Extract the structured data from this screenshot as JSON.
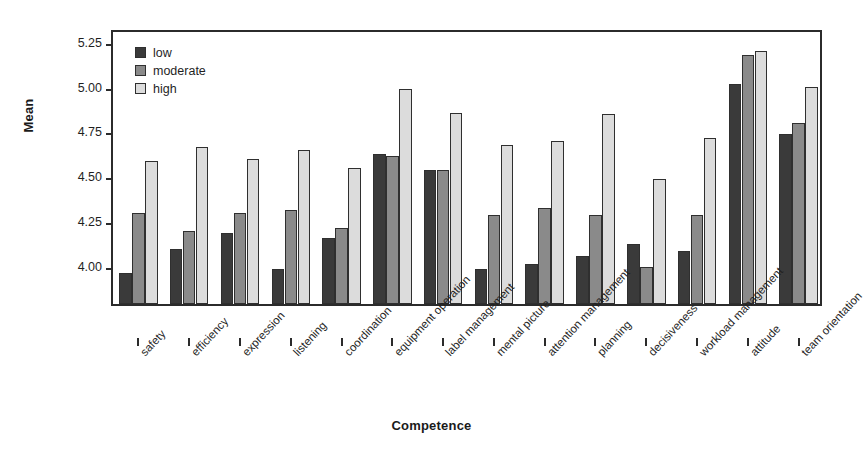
{
  "chart_data": {
    "type": "bar",
    "title": "",
    "xlabel": "Competence",
    "ylabel": "Mean",
    "ylim": [
      3.785,
      5.32
    ],
    "yticks": [
      "4.00",
      "4.25",
      "4.50",
      "4.75",
      "5.00",
      "5.25"
    ],
    "ytick_values": [
      4.0,
      4.25,
      4.5,
      4.75,
      5.0,
      5.25
    ],
    "grid": false,
    "legend_position": "top-left",
    "categories": [
      "safety",
      "efficiency",
      "expression",
      "listening",
      "coordination",
      "equipment operation",
      "label management",
      "mental picture",
      "attention management",
      "planning",
      "decisiveness",
      "workload management",
      "attitude",
      "team orientation"
    ],
    "series": [
      {
        "name": "low",
        "color": "#3a3a3a",
        "values": [
          3.96,
          4.09,
          4.18,
          3.98,
          4.15,
          4.62,
          4.53,
          3.98,
          4.01,
          4.05,
          4.12,
          4.08,
          5.01,
          4.73
        ]
      },
      {
        "name": "moderate",
        "color": "#8a8a8a",
        "values": [
          4.29,
          4.19,
          4.29,
          4.31,
          4.21,
          4.61,
          4.53,
          4.28,
          4.32,
          4.28,
          3.99,
          4.28,
          5.17,
          4.79
        ]
      },
      {
        "name": "high",
        "color": "#dcdcdc",
        "values": [
          4.58,
          4.66,
          4.59,
          4.64,
          4.54,
          4.98,
          4.85,
          4.67,
          4.69,
          4.84,
          4.48,
          4.71,
          5.19,
          4.99
        ]
      }
    ]
  },
  "legend": {
    "items": [
      {
        "label": "low"
      },
      {
        "label": "moderate"
      },
      {
        "label": "high"
      }
    ]
  }
}
